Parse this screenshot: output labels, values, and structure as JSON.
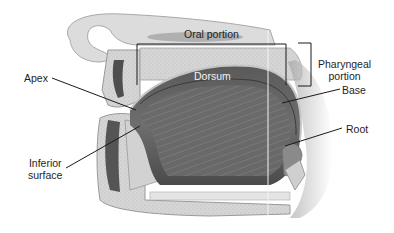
{
  "diagram": {
    "labels": {
      "oral_portion": "Oral portion",
      "pharyngeal_portion_line1": "Pharyngeal",
      "pharyngeal_portion_line2": "portion",
      "apex": "Apex",
      "dorsum": "Dorsum",
      "base": "Base",
      "root": "Root",
      "inferior_surface_line1": "Inferior",
      "inferior_surface_line2": "surface"
    },
    "colors": {
      "background": "#ffffff",
      "label_text": "#1e1e1e",
      "leader_line": "#1a1a1a",
      "tongue_dark": "#4a4a4a",
      "tongue_mid": "#7a7a7a",
      "bone": "#d9d9d9",
      "tissue_light": "#c8c8c8"
    }
  }
}
